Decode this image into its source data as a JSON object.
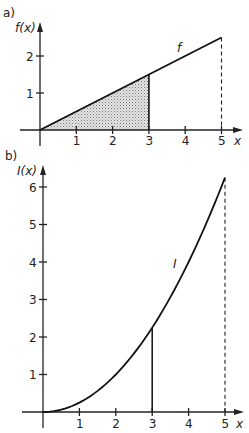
{
  "chart_data": [
    {
      "panel": "a)",
      "type": "line",
      "title": "",
      "xlabel": "x",
      "ylabel": "f(x)",
      "curve_label": "f",
      "function": "f(x) = x/2",
      "x": [
        0,
        1,
        2,
        3,
        4,
        5
      ],
      "values": [
        0,
        0.5,
        1,
        1.5,
        2,
        2.5
      ],
      "shaded_region": {
        "from": 0,
        "to": 3,
        "description": "area under f from 0 to 3, stippled gray"
      },
      "dashed_vertical_at": 5,
      "xlim": [
        0,
        5.5
      ],
      "ylim": [
        0,
        2.8
      ],
      "x_ticks": [
        "1",
        "2",
        "3",
        "4",
        "5"
      ],
      "y_ticks": [
        "1",
        "2"
      ],
      "grid": false,
      "legend": "none"
    },
    {
      "panel": "b)",
      "type": "line",
      "title": "",
      "xlabel": "x",
      "ylabel": "I(x)",
      "curve_label": "I",
      "function": "I(x) = x^2/4",
      "x": [
        0,
        1,
        2,
        3,
        4,
        5
      ],
      "values": [
        0,
        0.25,
        1,
        2.25,
        4,
        6.25
      ],
      "vertical_marker_at": {
        "x": 3,
        "y": 2.25
      },
      "dashed_vertical_at": 5,
      "xlim": [
        0,
        5.5
      ],
      "ylim": [
        0,
        6.7
      ],
      "x_ticks": [
        "1",
        "2",
        "3",
        "4",
        "5"
      ],
      "y_ticks": [
        "1",
        "2",
        "3",
        "4",
        "5",
        "6"
      ],
      "grid": false,
      "legend": "none"
    }
  ],
  "labels": {
    "panel_a": "a)",
    "panel_b": "b)",
    "a_ylabel": "f(x)",
    "b_ylabel": "I(x)",
    "xlabel": "x",
    "f_curve": "f",
    "i_curve": "I"
  }
}
